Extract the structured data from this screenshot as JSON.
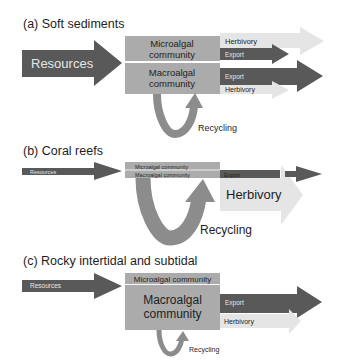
{
  "panels": {
    "a": {
      "title": "(a) Soft sediments",
      "input": "Resources",
      "micro": [
        "Microalgal",
        "community"
      ],
      "macro": [
        "Macroalgal",
        "community"
      ],
      "micro_out": {
        "herbivory": "Herbivory",
        "export": "Export"
      },
      "macro_out": {
        "export": "Export",
        "herbivory": "Herbivory"
      },
      "recycling": "Recycling"
    },
    "b": {
      "title": "(b) Coral reefs",
      "input": "Resources",
      "micro": "Microalgal community",
      "macro": "Macroalgal community",
      "export": "Export",
      "herbivory": "Herbivory",
      "recycling": "Recycling"
    },
    "c": {
      "title": "(c) Rocky intertidal and subtidal",
      "input": "Resources",
      "micro": "Microalgal community",
      "macro": [
        "Macroalgal",
        "community"
      ],
      "export": "Export",
      "herbivory": "Herbivory",
      "recycling": "Recycling"
    }
  },
  "colors": {
    "resources_arrow": "#595959",
    "export_arrow": "#595959",
    "herbivory_arrow": "#e5e5e5",
    "community_box": "#ababab",
    "recycling_loop": "#8c8c8c"
  }
}
